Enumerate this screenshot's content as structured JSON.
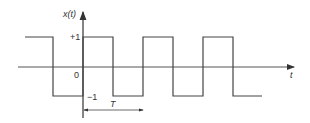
{
  "diagram": {
    "y_axis_label": "x(t)",
    "x_axis_label": "t",
    "level_high": "+1",
    "level_low": "−1",
    "origin_label": "0",
    "period_label": "T",
    "colors": {
      "stroke": "#444444",
      "background": "#ffffff"
    }
  }
}
